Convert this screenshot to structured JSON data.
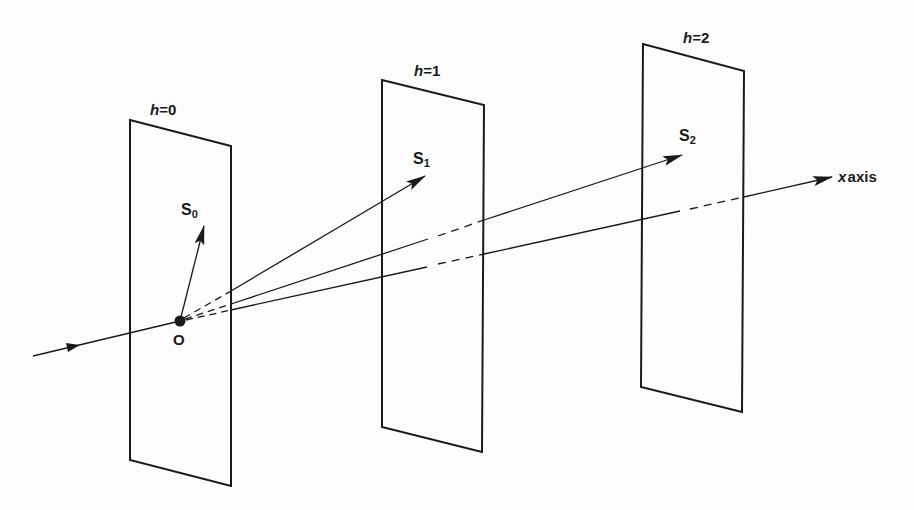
{
  "diagram": {
    "planes": [
      {
        "id": "h0",
        "var": "h",
        "eq": "=",
        "value": "0",
        "corners": [
          [
            130,
            120
          ],
          [
            231,
            146
          ],
          [
            231,
            486
          ],
          [
            130,
            460
          ]
        ]
      },
      {
        "id": "h1",
        "var": "h",
        "eq": "=",
        "value": "1",
        "corners": [
          [
            382,
            80
          ],
          [
            484,
            105
          ],
          [
            482,
            452
          ],
          [
            382,
            427
          ]
        ]
      },
      {
        "id": "h2",
        "var": "h",
        "eq": "=",
        "value": "2",
        "corners": [
          [
            643,
            44
          ],
          [
            744,
            71
          ],
          [
            742,
            412
          ],
          [
            641,
            387
          ]
        ]
      }
    ],
    "origin": {
      "label": "O",
      "x": 180,
      "y": 321
    },
    "vectors": [
      {
        "id": "S0",
        "base": "S",
        "sub": "0",
        "tip": [
          204,
          226
        ]
      },
      {
        "id": "S1",
        "base": "S",
        "sub": "1",
        "tip": [
          425,
          176
        ]
      },
      {
        "id": "S2",
        "base": "S",
        "sub": "2",
        "tip": [
          682,
          155
        ]
      }
    ],
    "axis": {
      "var": "x",
      "word": "axis",
      "tip": [
        832,
        177
      ]
    },
    "incoming_ray": {
      "start": [
        33,
        356
      ],
      "end": [
        180,
        321
      ]
    },
    "colors": {
      "line": "#1a1a1a",
      "background": "#fdfdfd"
    }
  }
}
